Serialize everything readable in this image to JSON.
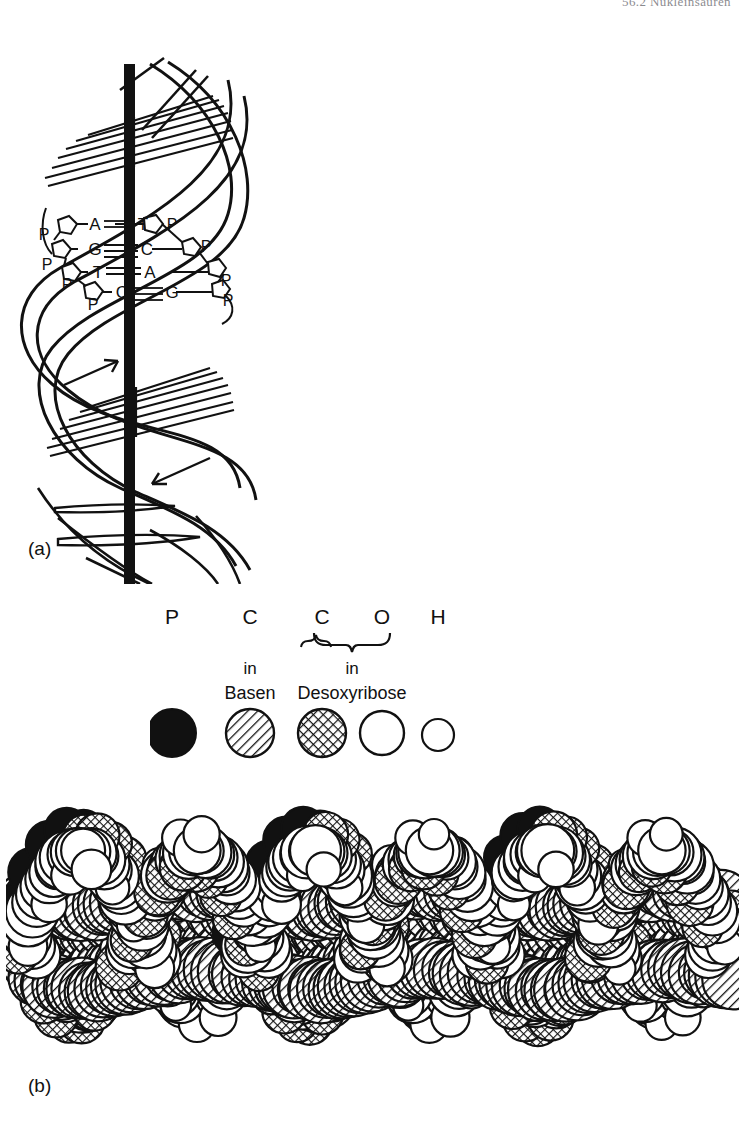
{
  "header": {
    "text": "56.2  Nukleinsäuren"
  },
  "figure": {
    "panel_a": {
      "label": "(a)",
      "axis_name": "helix-axis",
      "base_pairs": [
        {
          "left": "A",
          "bond": "=",
          "right": "T",
          "bond_type": "double"
        },
        {
          "left": "G",
          "bond": "≡",
          "right": "C",
          "bond_type": "triple"
        },
        {
          "left": "T",
          "bond": "=",
          "right": "A",
          "bond_type": "double"
        },
        {
          "left": "C",
          "bond": "≡",
          "right": "G",
          "bond_type": "triple"
        }
      ],
      "backbone_labels": [
        "P",
        "P",
        "P",
        "P",
        "P",
        "P",
        "P",
        "P"
      ],
      "arrows": [
        {
          "name": "strand-direction-arrow-up",
          "direction": "up-right"
        },
        {
          "name": "strand-direction-arrow-down",
          "direction": "down-left"
        }
      ]
    },
    "legend": {
      "items": [
        {
          "symbol": "P",
          "sub1": "",
          "sub2": "",
          "fill": "solid-black",
          "size": "large"
        },
        {
          "symbol": "C",
          "sub1": "in",
          "sub2": "Basen",
          "fill": "diagonal-hatch",
          "size": "large"
        },
        {
          "symbol": "C",
          "sub1": "in",
          "sub2": "Desoxyribose",
          "fill": "cross-hatch",
          "size": "large"
        },
        {
          "symbol": "O",
          "sub1": "",
          "sub2": "",
          "fill": "white",
          "size": "large"
        },
        {
          "symbol": "H",
          "sub1": "",
          "sub2": "",
          "fill": "white",
          "size": "small"
        }
      ],
      "brace_group": [
        "C",
        "O"
      ],
      "brace_caption": "in",
      "brace_label": "Desoxyribose"
    },
    "panel_b": {
      "label": "(b)",
      "model_name": "space-filling-dna-model"
    }
  },
  "colors": {
    "ink": "#111111",
    "paper": "#ffffff",
    "header": "#2a2a33"
  }
}
